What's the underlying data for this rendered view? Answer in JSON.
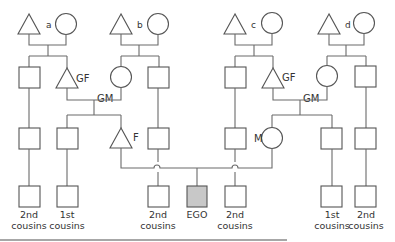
{
  "diagram": {
    "type": "kinship-chart",
    "great_grandparent_couples": [
      {
        "label": "a"
      },
      {
        "label": "b"
      },
      {
        "label": "c"
      },
      {
        "label": "d"
      }
    ],
    "labels": {
      "grandfather": "GF",
      "grandmother": "GM",
      "father": "F",
      "mother": "M",
      "ego": "EGO"
    },
    "cousin_labels": [
      {
        "line1": "2nd",
        "line2": "cousins"
      },
      {
        "line1": "1st",
        "line2": "cousins"
      },
      {
        "line1": "2nd",
        "line2": "cousins"
      },
      {
        "line1": "2nd",
        "line2": "cousins"
      },
      {
        "line1": "1st",
        "line2": "cousins"
      },
      {
        "line1": "2nd",
        "line2": "cousins"
      }
    ],
    "colors": {
      "line": "#6a6a6a",
      "ego_fill": "#c8c8c8",
      "shape_fill": "#ffffff"
    }
  }
}
